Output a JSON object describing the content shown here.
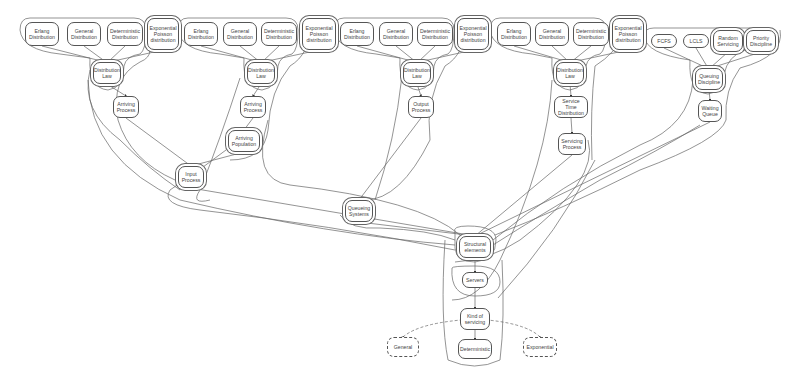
{
  "diagram": {
    "line_color": "#555555",
    "nodes": [
      {
        "id": "g1_erlang",
        "label": "Erlang\nDistribution",
        "x": 25,
        "y": 22,
        "w": 34,
        "h": 24
      },
      {
        "id": "g1_general",
        "label": "General\nDistribution",
        "x": 67,
        "y": 22,
        "w": 34,
        "h": 24
      },
      {
        "id": "g1_det",
        "label": "Deterministic\nDistribution",
        "x": 107,
        "y": 22,
        "w": 36,
        "h": 24
      },
      {
        "id": "g1_exp",
        "label": "Exponential\nPoisson\ndistribution",
        "x": 147,
        "y": 18,
        "w": 32,
        "h": 32
      },
      {
        "id": "g1_law",
        "label": "Distribution\nLaw",
        "x": 93,
        "y": 62,
        "w": 28,
        "h": 22
      },
      {
        "id": "arriving_process_1",
        "label": "Arriving\nProcess",
        "x": 113,
        "y": 96,
        "w": 26,
        "h": 22
      },
      {
        "id": "g2_erlang",
        "label": "Erlang\nDistribution",
        "x": 184,
        "y": 22,
        "w": 34,
        "h": 24
      },
      {
        "id": "g2_general",
        "label": "General\nDistribution",
        "x": 223,
        "y": 22,
        "w": 34,
        "h": 24
      },
      {
        "id": "g2_det",
        "label": "Deterministic\nDistribution",
        "x": 261,
        "y": 22,
        "w": 36,
        "h": 24
      },
      {
        "id": "g2_exp",
        "label": "Exponential\nPoisson\ndistribution",
        "x": 302,
        "y": 18,
        "w": 34,
        "h": 32
      },
      {
        "id": "g2_law",
        "label": "Distribution\nLaw",
        "x": 247,
        "y": 62,
        "w": 28,
        "h": 22
      },
      {
        "id": "arriving_process_2",
        "label": "Arriving\nProcess",
        "x": 240,
        "y": 96,
        "w": 26,
        "h": 22
      },
      {
        "id": "arriving_population",
        "label": "Arriving\nPopulation",
        "x": 228,
        "y": 130,
        "w": 32,
        "h": 22
      },
      {
        "id": "input_process",
        "label": "Input\nProcess",
        "x": 178,
        "y": 166,
        "w": 26,
        "h": 22
      },
      {
        "id": "g3_erlang",
        "label": "Erlang\nDistribution",
        "x": 340,
        "y": 22,
        "w": 34,
        "h": 24
      },
      {
        "id": "g3_general",
        "label": "General\nDistribution",
        "x": 379,
        "y": 22,
        "w": 34,
        "h": 24
      },
      {
        "id": "g3_det",
        "label": "Deterministic\nDistribution",
        "x": 417,
        "y": 22,
        "w": 36,
        "h": 24
      },
      {
        "id": "g3_exp",
        "label": "Exponential\nPoisson\ndistribution",
        "x": 457,
        "y": 18,
        "w": 32,
        "h": 32
      },
      {
        "id": "g3_law",
        "label": "Distribution\nLaw",
        "x": 403,
        "y": 62,
        "w": 28,
        "h": 22
      },
      {
        "id": "output_process",
        "label": "Output\nProcess",
        "x": 408,
        "y": 96,
        "w": 26,
        "h": 22
      },
      {
        "id": "queueing_systems",
        "label": "Queueing\nSystems",
        "x": 345,
        "y": 200,
        "w": 28,
        "h": 22
      },
      {
        "id": "g4_erlang",
        "label": "Erlang\nDistribution",
        "x": 497,
        "y": 22,
        "w": 34,
        "h": 24
      },
      {
        "id": "g4_general",
        "label": "General\nDistribution",
        "x": 535,
        "y": 22,
        "w": 34,
        "h": 24
      },
      {
        "id": "g4_det",
        "label": "Deterministic\nDistribution",
        "x": 573,
        "y": 22,
        "w": 36,
        "h": 24
      },
      {
        "id": "g4_exp",
        "label": "Exponential\nPoisson\ndistribution",
        "x": 612,
        "y": 18,
        "w": 32,
        "h": 32
      },
      {
        "id": "g4_law",
        "label": "Distribution\nLaw",
        "x": 556,
        "y": 62,
        "w": 28,
        "h": 22
      },
      {
        "id": "service_time_distribution",
        "label": "Service Time\nDistribution",
        "x": 554,
        "y": 96,
        "w": 34,
        "h": 22
      },
      {
        "id": "servicing_process",
        "label": "Servicing\nProcess",
        "x": 558,
        "y": 133,
        "w": 28,
        "h": 22
      },
      {
        "id": "fcfs",
        "label": "FCFS",
        "x": 651,
        "y": 34,
        "w": 26,
        "h": 14
      },
      {
        "id": "lcls",
        "label": "LCLS",
        "x": 683,
        "y": 34,
        "w": 26,
        "h": 14
      },
      {
        "id": "random_servicing",
        "label": "Random\nServicing",
        "x": 713,
        "y": 30,
        "w": 30,
        "h": 22
      },
      {
        "id": "priority_discipline",
        "label": "Priority\nDiscipline",
        "x": 746,
        "y": 30,
        "w": 30,
        "h": 22
      },
      {
        "id": "queuing_discipline",
        "label": "Queuing\nDiscipline",
        "x": 695,
        "y": 68,
        "w": 28,
        "h": 22
      },
      {
        "id": "waiting_queue",
        "label": "Waiting\nQueue",
        "x": 698,
        "y": 100,
        "w": 24,
        "h": 22
      },
      {
        "id": "structural_elements",
        "label": "Structural\nelements",
        "x": 459,
        "y": 236,
        "w": 32,
        "h": 22
      },
      {
        "id": "servers",
        "label": "Servers",
        "x": 462,
        "y": 272,
        "w": 26,
        "h": 16
      },
      {
        "id": "kind_of_servicing",
        "label": "Kind of\nservicing",
        "x": 460,
        "y": 308,
        "w": 30,
        "h": 22
      },
      {
        "id": "deterministic",
        "label": "Deterministic",
        "x": 458,
        "y": 339,
        "w": 34,
        "h": 20
      },
      {
        "id": "general",
        "label": "General",
        "x": 387,
        "y": 337,
        "w": 32,
        "h": 20,
        "dashed": true
      },
      {
        "id": "exponential",
        "label": "Exponential",
        "x": 523,
        "y": 337,
        "w": 34,
        "h": 20,
        "dashed": true
      }
    ]
  }
}
